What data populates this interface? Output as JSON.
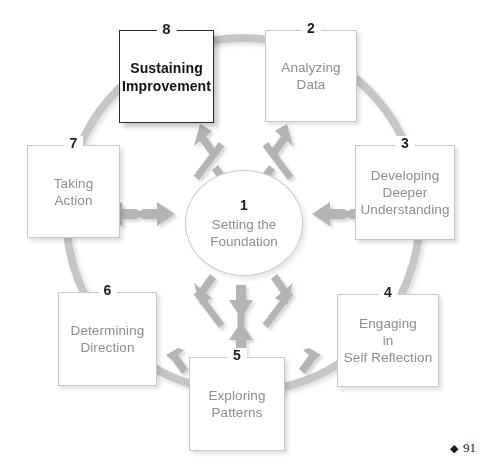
{
  "diagram": {
    "center": {
      "number": "1",
      "label": "Setting the\nFoundation"
    },
    "nodes": [
      {
        "number": "2",
        "label": "Analyzing\nData",
        "emphasis": false
      },
      {
        "number": "3",
        "label": "Developing\nDeeper\nUnderstanding",
        "emphasis": false
      },
      {
        "number": "4",
        "label": "Engaging\nin\nSelf Reflection",
        "emphasis": false
      },
      {
        "number": "5",
        "label": "Exploring\nPatterns",
        "emphasis": false
      },
      {
        "number": "6",
        "label": "Determining\nDirection",
        "emphasis": false
      },
      {
        "number": "7",
        "label": "Taking\nAction",
        "emphasis": false
      },
      {
        "number": "8",
        "label": "Sustaining\nImprovement",
        "emphasis": true
      }
    ],
    "colors": {
      "ring": "#c6c6c6",
      "arrow": "#b4b4b4",
      "box_border": "#c8c8c8",
      "box_text": "#8d8d8d",
      "emphasis_border": "#2a2a2a",
      "emphasis_text": "#111111",
      "number_text": "#1d1d1d",
      "background": "#ffffff"
    }
  },
  "footer": {
    "diamond": "◆",
    "page_number": "91"
  }
}
